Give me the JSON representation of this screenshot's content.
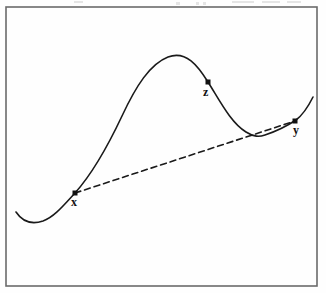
{
  "figure": {
    "canvas": {
      "width": 326,
      "height": 293,
      "background": "#fefefe"
    },
    "frame": {
      "name": "figure-border",
      "x": 6,
      "y": 7,
      "width": 311,
      "height": 279,
      "stroke": "#6b6b6b",
      "stroke_width": 1.6
    },
    "artifacts": {
      "description": "faint cut-off text remnants along the very top edge",
      "marks": [
        {
          "x": 74,
          "y": 1,
          "width": 9,
          "height": 2
        },
        {
          "x": 176,
          "y": 2,
          "width": 4,
          "height": 3
        },
        {
          "x": 196,
          "y": 2,
          "width": 3,
          "height": 3
        },
        {
          "x": 203,
          "y": 2,
          "width": 3,
          "height": 3
        },
        {
          "x": 232,
          "y": 1,
          "width": 22,
          "height": 2
        },
        {
          "x": 262,
          "y": 1,
          "width": 18,
          "height": 2
        },
        {
          "x": 287,
          "y": 1,
          "width": 14,
          "height": 2
        }
      ]
    }
  },
  "chart_data": {
    "type": "line",
    "xlabel": "",
    "ylabel": "",
    "xlim": [
      6,
      317
    ],
    "ylim": [
      7,
      286
    ],
    "grid": false,
    "legend": "none",
    "note": "Coordinates are in screen pixels; y increases downward.",
    "series": [
      {
        "name": "curve",
        "style": "solid",
        "color": "#1a1a1a",
        "stroke_width": 1.6,
        "path": "M 16 212 C 24 224, 34 224, 43 221 C 54 217, 63 206, 75 193 C 92 174, 106 150, 122 116 C 136 86, 150 64, 168 57 C 186 50, 198 66, 208 82 C 220 101, 231 123, 246 132 C 254 137, 259 137, 265 135 C 277 131, 287 126, 296 120 C 304 114, 309 105, 313 97",
        "points": [
          {
            "x": 16,
            "y": 212,
            "role": "left-endpoint"
          },
          {
            "x": 42,
            "y": 222,
            "role": "local-minimum"
          },
          {
            "x": 75,
            "y": 193,
            "role": "point-x"
          },
          {
            "x": 168,
            "y": 57,
            "role": "local-maximum"
          },
          {
            "x": 208,
            "y": 82,
            "role": "point-z"
          },
          {
            "x": 263,
            "y": 135,
            "role": "local-minimum"
          },
          {
            "x": 295,
            "y": 121,
            "role": "point-y"
          },
          {
            "x": 313,
            "y": 97,
            "role": "right-endpoint"
          }
        ]
      },
      {
        "name": "secant-line",
        "style": "dashed",
        "color": "#1a1a1a",
        "stroke_width": 1.6,
        "dash_pattern": "6,4",
        "from": {
          "x": 75,
          "y": 193
        },
        "to": {
          "x": 295,
          "y": 121
        }
      }
    ],
    "markers": [
      {
        "id": "x",
        "label": "x",
        "x": 75,
        "y": 193,
        "shape": "filled-square",
        "size": 5,
        "color": "#111111",
        "label_x": 71,
        "label_y": 196
      },
      {
        "id": "z",
        "label": "z",
        "x": 208,
        "y": 82,
        "shape": "filled-square",
        "size": 5,
        "color": "#111111",
        "label_x": 203,
        "label_y": 86
      },
      {
        "id": "y",
        "label": "y",
        "x": 295,
        "y": 121,
        "shape": "filled-square",
        "size": 5,
        "color": "#111111",
        "label_x": 293,
        "label_y": 124
      }
    ]
  }
}
